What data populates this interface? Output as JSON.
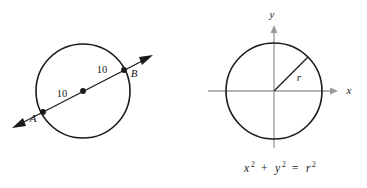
{
  "figure": {
    "colors": {
      "stroke": "#1a1a1a",
      "axis": "#9a9a9a",
      "background": "#ffffff"
    },
    "left_diagram": {
      "name": "circle-with-secant-line",
      "center_label": "",
      "point_a_label": "A",
      "point_b_label": "B",
      "segment_left_label": "10",
      "segment_right_label": "10"
    },
    "right_diagram": {
      "name": "circle-on-coordinate-plane",
      "x_axis_label": "x",
      "y_axis_label": "y",
      "radius_label": "r",
      "equation": {
        "x_base": "x",
        "x_exp": "2",
        "plus": "+",
        "y_base": "y",
        "y_exp": "2",
        "equals": "=",
        "r_base": "r",
        "r_exp": "2"
      }
    }
  }
}
